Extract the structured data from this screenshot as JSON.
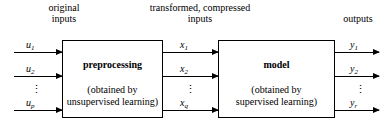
{
  "captions": {
    "original_inputs": "original\ninputs",
    "original_inputs_line1": "original",
    "original_inputs_line2": "inputs",
    "transformed_line1": "transformed, compressed",
    "transformed_line2": "inputs",
    "outputs": "outputs"
  },
  "boxes": {
    "preprocessing": {
      "title": "preprocessing",
      "subtitle_line1": "(obtained by",
      "subtitle_line2": "unsupervised learning)"
    },
    "model": {
      "title": "model",
      "subtitle_line1": "(obtained by",
      "subtitle_line2": "supervised learning)"
    }
  },
  "signals": {
    "inputs": [
      {
        "base": "u",
        "sub": "1",
        "full": "u1"
      },
      {
        "base": "u",
        "sub": "2",
        "full": "u2"
      },
      {
        "base": "u",
        "sub": "p",
        "full": "up"
      }
    ],
    "intermediate": [
      {
        "base": "x",
        "sub": "1",
        "full": "x1"
      },
      {
        "base": "x",
        "sub": "2",
        "full": "x2"
      },
      {
        "base": "x",
        "sub": "q",
        "full": "xq"
      }
    ],
    "outputs": [
      {
        "base": "y",
        "sub": "1",
        "full": "y1"
      },
      {
        "base": "y",
        "sub": "2",
        "full": "y2"
      },
      {
        "base": "y",
        "sub": "r",
        "full": "yr"
      }
    ],
    "ellipsis": "⋮"
  },
  "colors": {
    "stroke": "#000000",
    "background": "#ffffff",
    "text": "#000000"
  }
}
